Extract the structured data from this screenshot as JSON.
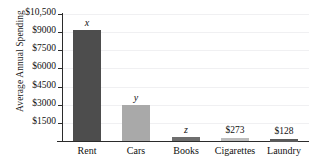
{
  "chart_data": {
    "type": "bar",
    "title": "",
    "xlabel": "",
    "ylabel": "Average Annual Spending",
    "categories": [
      "Rent",
      "Cars",
      "Books",
      "Cigarettes",
      "Laundry"
    ],
    "values": [
      9150,
      3000,
      290,
      273,
      128
    ],
    "value_labels": [
      "x",
      "y",
      "z",
      "$273",
      "$128"
    ],
    "ylim": [
      0,
      10500
    ],
    "yticks": [
      1500,
      3000,
      4500,
      6000,
      7500,
      9000,
      10500
    ],
    "ytick_labels": [
      "$1500",
      "$3000",
      "$4500",
      "$6000",
      "$7500",
      "$9000",
      "$10,500"
    ],
    "grid": true,
    "legend": "none",
    "bar_colors": [
      "#4d4d4d",
      "#a9a9a9",
      "#6e6e6e",
      "#bcbcbc",
      "#5a5a5a"
    ]
  },
  "axis": {
    "y_title": "Average Annual Spending"
  },
  "colors": {
    "axis": "#2b2b2b",
    "gridline": "#f0f0f2",
    "text": "#111111",
    "background": "#ffffff"
  }
}
